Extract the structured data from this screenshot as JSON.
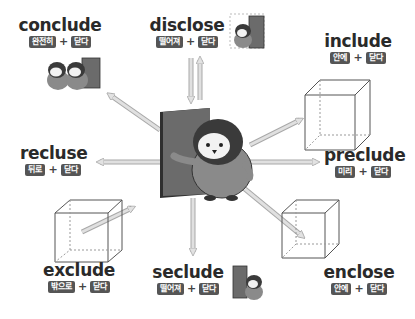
{
  "center": {
    "description": "penguin opening a door (close = 닫다)"
  },
  "words": [
    {
      "id": "conclude",
      "english": "conclude",
      "prefix_meaning": "완전히",
      "plus": "+",
      "root_meaning": "닫다"
    },
    {
      "id": "disclose",
      "english": "disclose",
      "prefix_meaning": "떨어져",
      "plus": "+",
      "root_meaning": "닫다"
    },
    {
      "id": "include",
      "english": "include",
      "prefix_meaning": "안에",
      "plus": "+",
      "root_meaning": "닫다"
    },
    {
      "id": "recluse",
      "english": "recluse",
      "prefix_meaning": "뒤로",
      "plus": "+",
      "root_meaning": "닫다"
    },
    {
      "id": "preclude",
      "english": "preclude",
      "prefix_meaning": "미리",
      "plus": "+",
      "root_meaning": "닫다"
    },
    {
      "id": "exclude",
      "english": "exclude",
      "prefix_meaning": "밖으로",
      "plus": "+",
      "root_meaning": "닫다"
    },
    {
      "id": "seclude",
      "english": "seclude",
      "prefix_meaning": "떨어져",
      "plus": "+",
      "root_meaning": "닫다"
    },
    {
      "id": "enclose",
      "english": "enclose",
      "prefix_meaning": "안에",
      "plus": "+",
      "root_meaning": "닫다"
    }
  ],
  "colors": {
    "tag_bg": "#555555",
    "tag_text": "#ffffff",
    "text": "#2a2a2a",
    "arrow": "#d6d6d6",
    "arrow_edge": "#a8a8a8",
    "door": "#6b6b6b",
    "penguin_body": "#8a8a8a",
    "penguin_head": "#3a3a3a"
  }
}
